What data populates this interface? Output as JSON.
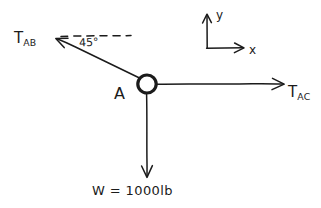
{
  "diagram": {
    "background_color": "#ffffff",
    "ink_color": "#1b1b1b",
    "node": {
      "label": "A",
      "shape": "ring",
      "center_x": 147,
      "center_y": 84,
      "radius": 9
    },
    "forces": [
      {
        "name": "T_AB",
        "label_main": "T",
        "label_sub": "AB",
        "direction": "up-left",
        "angle_from_horizontal_deg": 45,
        "arrow_from": [
          138,
          78
        ],
        "arrow_to": [
          56,
          39
        ]
      },
      {
        "name": "T_AC",
        "label_main": "T",
        "label_sub": "AC",
        "direction": "right",
        "angle_from_horizontal_deg": 0,
        "arrow_from": [
          156,
          84
        ],
        "arrow_to": [
          283,
          84
        ]
      },
      {
        "name": "W",
        "label_main": "W = 1000lb",
        "label_sub": "",
        "direction": "down",
        "angle_from_horizontal_deg": 270,
        "arrow_from": [
          147,
          94
        ],
        "arrow_to": [
          147,
          176
        ]
      }
    ],
    "angle_annotation": {
      "value": "45°",
      "reference_line": "dashed-horizontal",
      "dash_from": [
        60,
        36
      ],
      "dash_to": [
        132,
        36
      ]
    },
    "axes": {
      "origin": [
        207,
        48
      ],
      "x_label": "x",
      "y_label": "y",
      "x_tip": [
        243,
        48
      ],
      "y_tip": [
        207,
        14
      ]
    }
  }
}
